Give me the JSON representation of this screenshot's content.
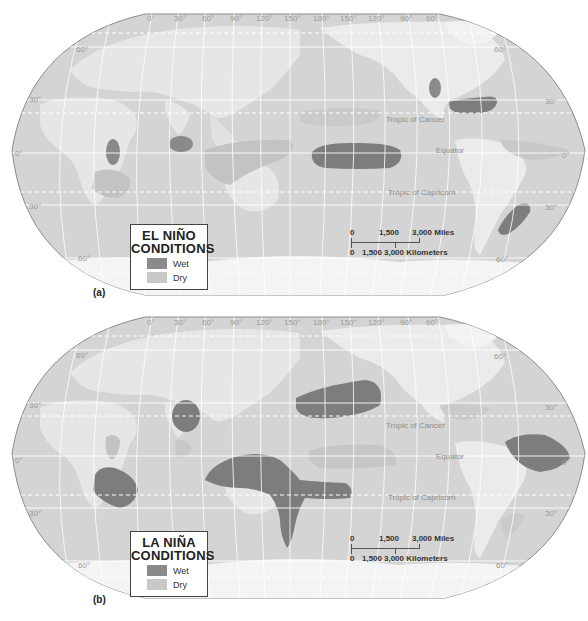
{
  "figure": {
    "panels": [
      {
        "id": "a",
        "panel_label": "(a)",
        "legend": {
          "title_line1": "EL NIÑO",
          "title_line2": "CONDITIONS",
          "items": [
            {
              "label": "Wet",
              "color": "#8a8a8a"
            },
            {
              "label": "Dry",
              "color": "#c8c8c8"
            }
          ]
        },
        "wet_regions": [
          "East Africa",
          "Southern India / Sri Lanka",
          "Central equatorial Pacific",
          "Western United States (Great Basin)",
          "Southern United States / Gulf Coast",
          "Southeastern South America"
        ],
        "dry_regions": [
          "Southern Africa",
          "Indonesia / Northern Australia",
          "Western Pacific",
          "Northern South America"
        ]
      },
      {
        "id": "b",
        "panel_label": "(b)",
        "legend": {
          "title_line1": "LA NIÑA",
          "title_line2": "CONDITIONS",
          "items": [
            {
              "label": "Wet",
              "color": "#8a8a8a"
            },
            {
              "label": "Dry",
              "color": "#c8c8c8"
            }
          ]
        },
        "wet_regions": [
          "Southern Africa",
          "India",
          "Indonesia / Northern & Eastern Australia",
          "North-central Pacific",
          "Northern South America"
        ],
        "dry_regions": [
          "East Africa",
          "Central equatorial Pacific",
          "Southern United States",
          "Southeastern South America"
        ]
      }
    ],
    "graticule": {
      "longitude_labels_top": [
        "0°",
        "30°",
        "60°",
        "90°",
        "120°",
        "150°",
        "180°",
        "150°",
        "120°",
        "90°",
        "60°"
      ],
      "latitude_labels_left": [
        "60°",
        "30°",
        "0°",
        "30°",
        "60°"
      ],
      "latitude_labels_right": [
        "60°",
        "30°",
        "0°",
        "30°",
        "60°"
      ]
    },
    "reference_lines": {
      "tropic_cancer": "Tropic of Cancer",
      "equator": "Equator",
      "tropic_capricorn": "Tropic of Capricorn"
    },
    "scale_bar": {
      "miles": [
        "0",
        "1,500",
        "3,000 Miles"
      ],
      "kilometers": [
        "0",
        "1,500",
        "3,000 Kilometers"
      ]
    },
    "colors": {
      "ocean": "#d4d4d4",
      "land": "#e6e6e6",
      "ice": "#f4f4f4",
      "wet": "#8a8a8a",
      "dry": "#c4c4c4",
      "grid": "#ffffff",
      "border": "#8c8c8c"
    }
  }
}
